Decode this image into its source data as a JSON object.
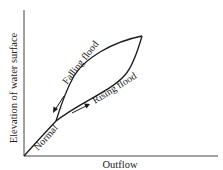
{
  "diagram": {
    "type": "stage-outflow hysteresis loop",
    "y_axis_label": "Elevation of water surface",
    "x_axis_label": "Outflow",
    "curve_labels": {
      "normal": "Normal",
      "rising": "Rising flood",
      "falling": "Falling flood"
    },
    "arrows": {
      "rising_direction": "up-right along lower branch",
      "falling_direction": "down-left along upper branch"
    },
    "colors": {
      "line": "#1a1a1a",
      "axis": "#333333",
      "background": "#ffffff"
    }
  }
}
